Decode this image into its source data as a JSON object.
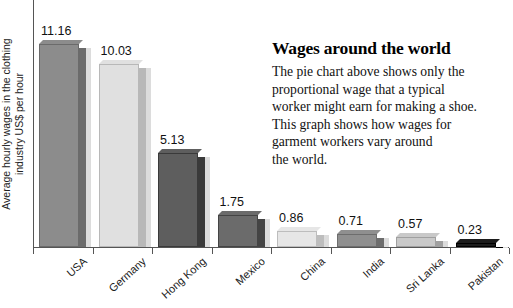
{
  "chart_data": {
    "type": "bar",
    "title": "",
    "xlabel": "",
    "ylabel_line1": "Average hourly wages in the clothing",
    "ylabel_line2": "industry US$ per hour",
    "categories": [
      "USA",
      "Germany",
      "Hong Kong",
      "Mexico",
      "China",
      "India",
      "Sri Lanka",
      "Pakistan"
    ],
    "values": [
      11.16,
      10.03,
      5.13,
      1.75,
      0.86,
      0.71,
      0.57,
      0.23
    ],
    "value_labels": [
      "11.16",
      "10.03",
      "5.13",
      "1.75",
      "0.86",
      "0.71",
      "0.57",
      "0.23"
    ],
    "bar_colors": [
      "#8c8c8c",
      "#e0e0e0",
      "#5e5e5e",
      "#6b6b6b",
      "#e6e6e6",
      "#8f8f8f",
      "#c9c9c9",
      "#1c1c1c"
    ],
    "bar_side_colors": [
      "#6b6b6b",
      "#b8b8b8",
      "#3a3a3a",
      "#444444",
      "#bdbdbd",
      "#6d6d6d",
      "#a0a0a0",
      "#000000"
    ],
    "ylim": [
      0,
      12.6
    ],
    "grid": false,
    "legend": "none"
  },
  "article": {
    "title": "Wages around the world",
    "lines": [
      "The pie chart above shows only the",
      "proportional wage that a typical",
      "worker might earn for making a shoe.",
      "This graph shows how wages for",
      "garment workers vary around",
      "the world."
    ]
  }
}
